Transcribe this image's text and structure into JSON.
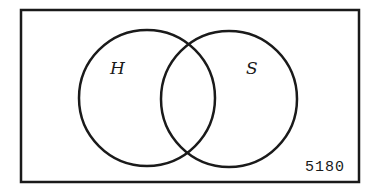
{
  "diagram": {
    "type": "venn",
    "universe": {
      "border_color": "#1a1a1a"
    },
    "sets": [
      {
        "label": "H",
        "color": "#1a1a1a"
      },
      {
        "label": "S",
        "color": "#1a1a1a"
      }
    ],
    "figure_id": "5180"
  }
}
